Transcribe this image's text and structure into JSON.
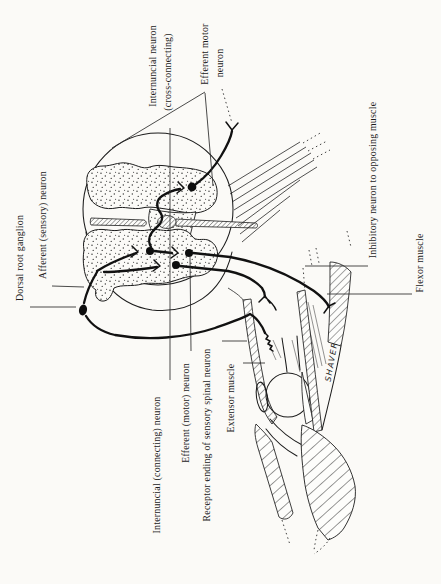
{
  "figure": {
    "ink_color": "#1c1c1c",
    "paper_color": "#fbfaf7",
    "labels": {
      "dorsal_root_ganglion": "Dorsal root ganglion",
      "afferent_sensory_neuron": "Afferent (sensory) neuron",
      "internuncial_cross_line1": "Internuncial neuron",
      "internuncial_cross_line2": "(cross-connecting)",
      "efferent_motor_top_line1": "Efferent motor",
      "efferent_motor_top_line2": "neuron",
      "inhibitory_neuron": "Inhibitory neuron to opposing muscle",
      "flexor_muscle": "Flexor muscle",
      "internuncial_connecting": "Internuncial (connecting) neuron",
      "efferent_motor_bottom": "Efferent (motor) neuron",
      "receptor_ending": "Receptor ending of sensory spinal neuron",
      "extensor_muscle": "Extensor muscle",
      "shaver": "SHAVER"
    }
  }
}
